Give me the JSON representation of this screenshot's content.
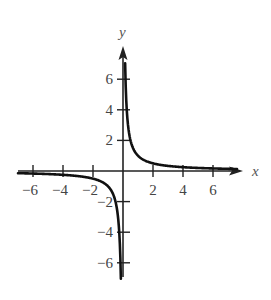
{
  "chart_data": {
    "type": "line",
    "title": "",
    "xlabel": "x",
    "ylabel": "y",
    "xlim": [
      -7,
      8
    ],
    "ylim": [
      -7,
      8
    ],
    "grid": false,
    "legend": null,
    "x_ticks": [
      -6,
      -4,
      -2,
      2,
      4,
      6
    ],
    "y_ticks": [
      6,
      4,
      2,
      -2,
      -4,
      -6
    ],
    "x_tick_labels": [
      "−6",
      "−4",
      "−2",
      "2",
      "4",
      "6"
    ],
    "y_tick_labels": [
      "6",
      "4",
      "2",
      "−2",
      "−4",
      "−6"
    ],
    "series": [
      {
        "name": "y = 1/x (right branch)",
        "x": [
          0.14,
          0.2,
          0.3,
          0.5,
          0.75,
          1,
          1.5,
          2,
          3,
          4,
          5,
          6,
          7.5
        ],
        "y": [
          7,
          5,
          3.33,
          2,
          1.33,
          1,
          0.67,
          0.5,
          0.33,
          0.25,
          0.2,
          0.17,
          0.13
        ]
      },
      {
        "name": "y = 1/x (left branch)",
        "x": [
          -7,
          -6,
          -5,
          -4,
          -3,
          -2,
          -1.5,
          -1,
          -0.75,
          -0.5,
          -0.3,
          -0.2,
          -0.14
        ],
        "y": [
          -0.14,
          -0.17,
          -0.2,
          -0.25,
          -0.33,
          -0.5,
          -0.67,
          -1,
          -1.33,
          -2,
          -3.33,
          -5,
          -7
        ]
      }
    ]
  }
}
